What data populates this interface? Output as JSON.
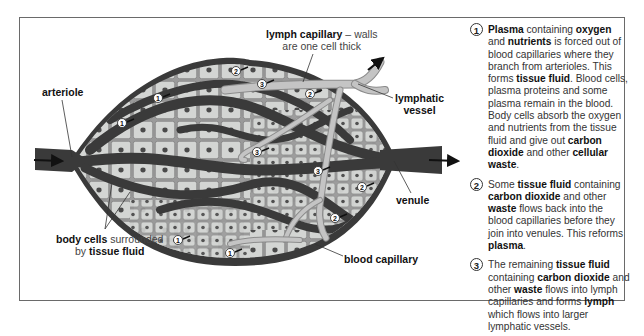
{
  "diagram": {
    "labels": {
      "arteriole": "arteriole",
      "lymph_capillary_bold": "lymph capillary",
      "lymph_capillary_rest": " – walls",
      "lymph_capillary_line2": "are one cell thick",
      "lymphatic_vessel_line1": "lymphatic",
      "lymphatic_vessel_line2": "vessel",
      "venule": "venule",
      "blood_capillary": "blood capillary",
      "body_cells_bold": "body cells",
      "body_cells_rest": " surrounded",
      "by_text": "by ",
      "tissue_fluid_bold": "tissue fluid"
    },
    "markers": [
      {
        "num": "1",
        "x": 122,
        "y": 123
      },
      {
        "num": "1",
        "x": 158,
        "y": 98
      },
      {
        "num": "2",
        "x": 236,
        "y": 71
      },
      {
        "num": "3",
        "x": 262,
        "y": 84
      },
      {
        "num": "2",
        "x": 310,
        "y": 94
      },
      {
        "num": "3",
        "x": 257,
        "y": 152
      },
      {
        "num": "3",
        "x": 318,
        "y": 171
      },
      {
        "num": "2",
        "x": 362,
        "y": 187
      },
      {
        "num": "2",
        "x": 335,
        "y": 218
      },
      {
        "num": "1",
        "x": 178,
        "y": 240
      },
      {
        "num": "1",
        "x": 230,
        "y": 253
      }
    ],
    "colors": {
      "vessel": "#3a3a3a",
      "tissue_bg": "#9a9a9a",
      "cell_fill": "#cfd1cf",
      "cell_border": "#8a8a8a",
      "nucleus": "#4a4a4a",
      "lymph": "#c4c4c4",
      "lymph_border": "#8c8c8c"
    }
  },
  "notes": [
    {
      "num": "1",
      "parts": [
        {
          "b": true,
          "t": "Plasma"
        },
        {
          "b": false,
          "t": " containing "
        },
        {
          "b": true,
          "t": "oxygen"
        },
        {
          "b": false,
          "t": " and "
        },
        {
          "b": true,
          "t": "nutrients"
        },
        {
          "b": false,
          "t": " is forced out of blood capillaries where they branch from arterioles. This forms "
        },
        {
          "b": true,
          "t": "tissue fluid"
        },
        {
          "b": false,
          "t": ". Blood cells, plasma proteins and some plasma remain in the blood. Body cells absorb the oxygen and nutrients from the tissue fluid and give out "
        },
        {
          "b": true,
          "t": "carbon dioxide"
        },
        {
          "b": false,
          "t": " and other "
        },
        {
          "b": true,
          "t": "cellular waste"
        },
        {
          "b": false,
          "t": "."
        }
      ]
    },
    {
      "num": "2",
      "parts": [
        {
          "b": false,
          "t": "Some "
        },
        {
          "b": true,
          "t": "tissue fluid"
        },
        {
          "b": false,
          "t": " containing "
        },
        {
          "b": true,
          "t": "carbon dioxide"
        },
        {
          "b": false,
          "t": " and other "
        },
        {
          "b": true,
          "t": "waste"
        },
        {
          "b": false,
          "t": " flows back into the blood capillaries before they join into venules. This reforms "
        },
        {
          "b": true,
          "t": "plasma"
        },
        {
          "b": false,
          "t": "."
        }
      ]
    },
    {
      "num": "3",
      "parts": [
        {
          "b": false,
          "t": "The remaining "
        },
        {
          "b": true,
          "t": "tissue fluid"
        },
        {
          "b": false,
          "t": " containing "
        },
        {
          "b": true,
          "t": "carbon dioxide"
        },
        {
          "b": false,
          "t": " and other "
        },
        {
          "b": true,
          "t": "waste"
        },
        {
          "b": false,
          "t": " flows into lymph capillaries and forms "
        },
        {
          "b": true,
          "t": "lymph"
        },
        {
          "b": false,
          "t": " which flows into larger lymphatic vessels."
        }
      ]
    }
  ]
}
